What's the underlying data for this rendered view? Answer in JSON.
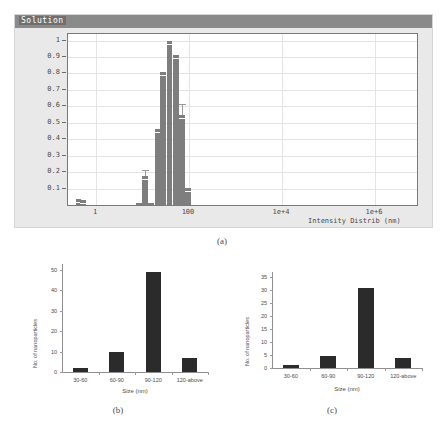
{
  "panel_a": {
    "window_title": "Solution",
    "caption": "(a)",
    "chart_data": {
      "type": "bar",
      "title": "Solution",
      "xlabel": "Intensity Distrib (nm)",
      "ylabel": "",
      "x_scale": "log",
      "xticks": [
        "1",
        "100",
        "1e+4",
        "1e+6"
      ],
      "xtick_values": [
        1,
        100,
        10000,
        1000000
      ],
      "xlim": [
        0.25,
        8000000
      ],
      "yticks": [
        "0.1",
        "0.2",
        "0.3",
        "0.4",
        "0.5",
        "0.6",
        "0.7",
        "0.8",
        "0.9",
        "1"
      ],
      "ytick_values": [
        0.1,
        0.2,
        0.3,
        0.4,
        0.5,
        0.6,
        0.7,
        0.8,
        0.9,
        1
      ],
      "ylim": [
        0,
        1.04
      ],
      "grid": true,
      "bar_color": "#7e7e7e",
      "bars": [
        {
          "center_nm": 0.42,
          "value": 0.035,
          "err_top": 0.035
        },
        {
          "center_nm": 0.52,
          "value": 0.028,
          "err_top": 0.028
        },
        {
          "center_nm": 8.5,
          "value": 0.01,
          "err_top": 0.01
        },
        {
          "center_nm": 11.5,
          "value": 0.175,
          "err_top": 0.215
        },
        {
          "center_nm": 15.5,
          "value": 0.01,
          "err_top": 0.01
        },
        {
          "center_nm": 21.0,
          "value": 0.465,
          "err_top": 0.465
        },
        {
          "center_nm": 28.0,
          "value": 0.81,
          "err_top": 0.81
        },
        {
          "center_nm": 38.0,
          "value": 1.0,
          "err_top": 1.0
        },
        {
          "center_nm": 52.0,
          "value": 0.915,
          "err_top": 0.915
        },
        {
          "center_nm": 70.0,
          "value": 0.545,
          "err_top": 0.615
        },
        {
          "center_nm": 95.0,
          "value": 0.105,
          "err_top": 0.105
        }
      ]
    }
  },
  "panel_b": {
    "caption": "(b)",
    "chart_data": {
      "type": "bar",
      "title": "",
      "xlabel": "Size (nm)",
      "ylabel": "No. of nanoparticles",
      "categories": [
        "30-60",
        "60-90",
        "90-120",
        "120-above"
      ],
      "values": [
        2,
        10,
        49,
        7
      ],
      "yticks": [
        "0",
        "10",
        "20",
        "30",
        "40",
        "50"
      ],
      "ytick_values": [
        0,
        10,
        20,
        30,
        40,
        50
      ],
      "ylim": [
        0,
        53
      ],
      "grid": false,
      "bar_color": "#2b2b2b"
    }
  },
  "panel_c": {
    "caption": "(c)",
    "chart_data": {
      "type": "bar",
      "title": "",
      "xlabel": "Size (nm)",
      "ylabel": "No. of nanoparticles",
      "categories": [
        "30-60",
        "60-90",
        "90-120",
        "120-above"
      ],
      "values": [
        1,
        4.5,
        31,
        4
      ],
      "yticks": [
        "0",
        "5",
        "10",
        "15",
        "20",
        "25",
        "30",
        "35"
      ],
      "ytick_values": [
        0,
        5,
        10,
        15,
        20,
        25,
        30,
        35
      ],
      "ylim": [
        0,
        37
      ],
      "grid": false,
      "bar_color": "#2b2b2b"
    }
  }
}
